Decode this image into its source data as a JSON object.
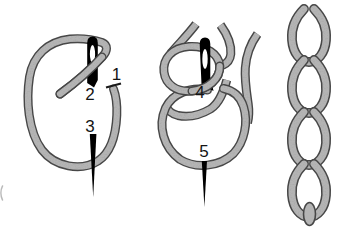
{
  "figure": {
    "background": "#ffffff",
    "colors": {
      "thread_fill": "#b4b4b4",
      "thread_outline": "#474747",
      "needle": "#000000",
      "needle_eye": "#ffffff",
      "label_text": "#141414"
    },
    "panels": [
      {
        "id": "step-1-loop-with-needle",
        "point_labels": [
          "1",
          "2",
          "3"
        ]
      },
      {
        "id": "step-2-needle-through-loops",
        "point_labels": [
          "4",
          "5"
        ]
      },
      {
        "id": "step-3-finished-chain",
        "point_labels": []
      }
    ]
  }
}
